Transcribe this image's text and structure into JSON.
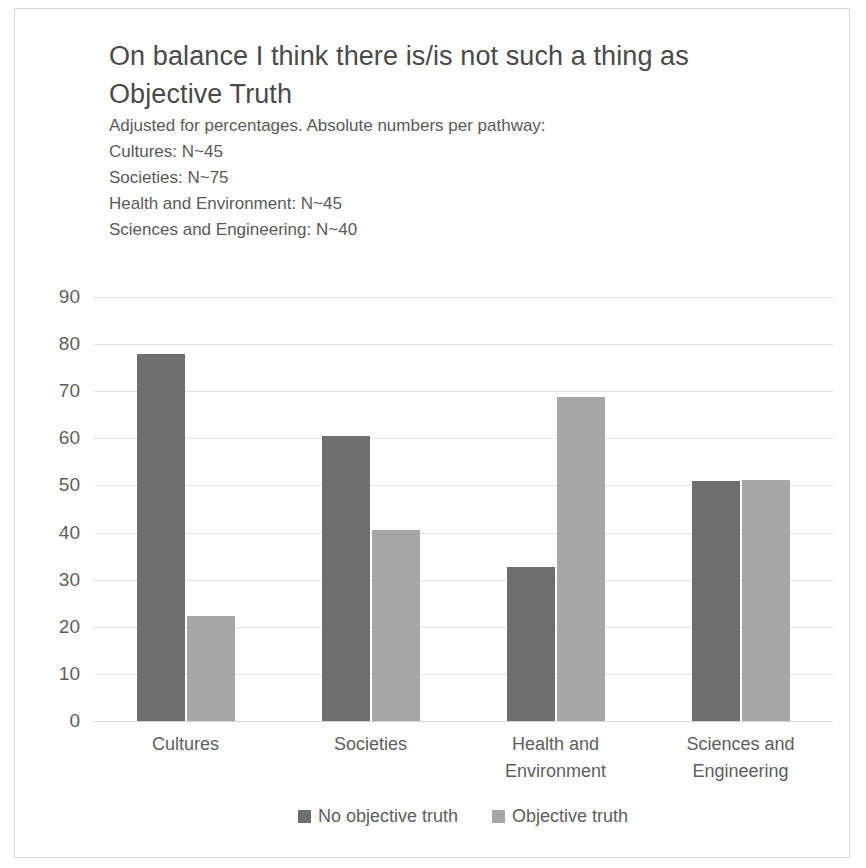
{
  "chart_data": {
    "type": "bar",
    "title": "On balance I think there is/is not such a thing as Objective Truth",
    "title_line1": "On balance I think there is/is not such a thing as",
    "title_line2": "Objective Truth",
    "subtitle_lines": [
      "Adjusted for percentages. Absolute numbers per pathway:",
      "Cultures: N~45",
      "Societies: N~75",
      "Health and Environment: N~45",
      "Sciences and Engineering: N~40"
    ],
    "categories": [
      "Cultures",
      "Societies",
      "Health and\nEnvironment",
      "Sciences and\nEngineering"
    ],
    "category_lines": [
      [
        "Cultures"
      ],
      [
        "Societies"
      ],
      [
        "Health and",
        "Environment"
      ],
      [
        "Sciences and",
        "Engineering"
      ]
    ],
    "series": [
      {
        "name": "No objective truth",
        "color": "#6e6e6e",
        "values": [
          78,
          60.5,
          32.7,
          51
        ]
      },
      {
        "name": "Objective truth",
        "color": "#a6a6a6",
        "values": [
          22.3,
          40.6,
          68.8,
          51.1
        ]
      }
    ],
    "xlabel": "",
    "ylabel": "",
    "ylim": [
      0,
      90
    ],
    "ytick_step": 10,
    "yticks": [
      90,
      80,
      70,
      60,
      50,
      40,
      30,
      20,
      10,
      0
    ],
    "grid": true,
    "legend_position": "bottom"
  }
}
